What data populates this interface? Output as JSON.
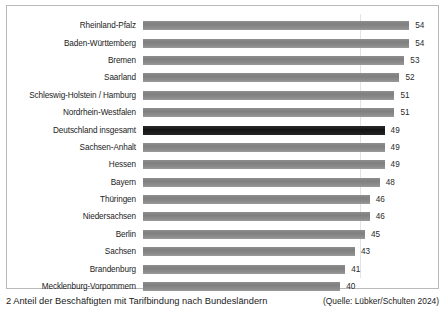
{
  "chart_data": {
    "type": "bar",
    "orientation": "horizontal",
    "title": "",
    "xlabel": "",
    "ylabel": "",
    "xlim": [
      0,
      58
    ],
    "grid": true,
    "gridline_values": [
      44
    ],
    "legend": "none",
    "value_suffix": "",
    "categories": [
      "Rheinland-Pfalz",
      "Baden-Württemberg",
      "Bremen",
      "Saarland",
      "Schleswig-Holstein / Hamburg",
      "Nordrhein-Westfalen",
      "Deutschland insgesamt",
      "Sachsen-Anhalt",
      "Hessen",
      "Bayern",
      "Thüringen",
      "Niedersachsen",
      "Berlin",
      "Sachsen",
      "Brandenburg",
      "Mecklenburg-Vorpommern"
    ],
    "values": [
      54,
      54,
      53,
      52,
      51,
      51,
      49,
      49,
      49,
      48,
      46,
      46,
      45,
      43,
      41,
      40
    ],
    "highlight_index": 6,
    "colors": {
      "bar": "#878787",
      "bar_highlight": "#1e1e1e",
      "frame": "#b9b9b9",
      "gridline": "#e3e3e3",
      "text": "#1c1c1c"
    }
  },
  "caption": {
    "number": "2",
    "text": "2 Anteil der Beschäftigten mit Tarifbindung nach Bundesländern",
    "source": "(Quelle: Lübker/Schulten 2024)"
  }
}
